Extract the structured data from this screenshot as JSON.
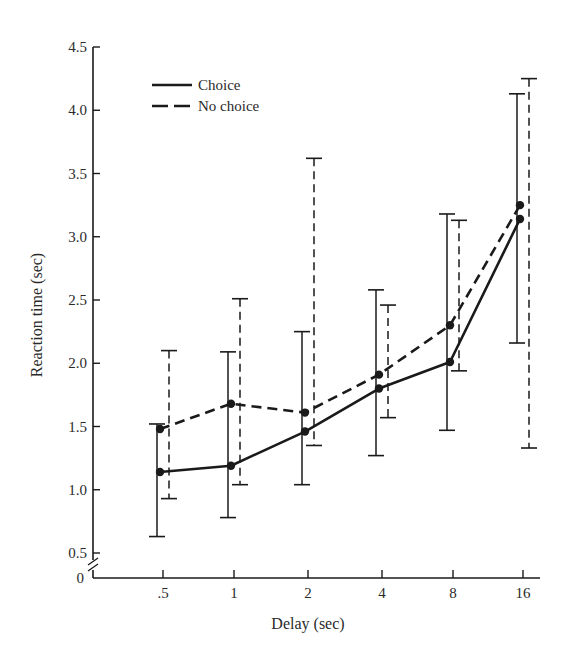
{
  "chart_data": {
    "type": "line",
    "title": "",
    "xlabel": "Delay (sec)",
    "ylabel": "Reaction time (sec)",
    "categories": [
      ".5",
      "1",
      "2",
      "4",
      "8",
      "16"
    ],
    "x": [
      0.5,
      1,
      2,
      4,
      8,
      16
    ],
    "ylim": [
      0,
      4.5
    ],
    "y_axis_break": true,
    "y_ticks": [
      "0",
      "0.5",
      "1.0",
      "1.5",
      "2.0",
      "2.5",
      "3.0",
      "3.5",
      "4.0",
      "4.5"
    ],
    "grid": false,
    "legend_position": "upper-left",
    "series": [
      {
        "name": "Choice",
        "style": "solid",
        "values": [
          1.14,
          1.19,
          1.46,
          1.8,
          2.01,
          3.14
        ],
        "error_low": [
          0.63,
          0.78,
          1.04,
          1.27,
          1.47,
          2.16
        ],
        "error_high": [
          1.52,
          2.09,
          2.25,
          2.58,
          3.18,
          4.13
        ]
      },
      {
        "name": "No choice",
        "style": "dashed",
        "values": [
          1.48,
          1.68,
          1.61,
          1.91,
          2.3,
          3.25
        ],
        "error_low": [
          0.93,
          1.04,
          1.35,
          1.57,
          1.94,
          1.33
        ],
        "error_high": [
          2.1,
          2.51,
          3.62,
          2.46,
          3.13,
          4.25
        ]
      }
    ]
  },
  "legend": {
    "items": [
      {
        "label": "Choice",
        "style": "solid"
      },
      {
        "label": "No choice",
        "style": "dashed"
      }
    ]
  },
  "colors": {
    "ink": "#1a1a1a",
    "background": "#ffffff"
  }
}
